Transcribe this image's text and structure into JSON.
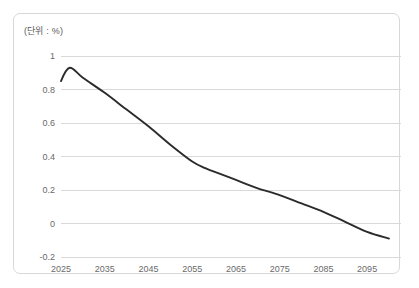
{
  "chart_data": {
    "type": "line",
    "title": "",
    "subtitle": "",
    "unit_label": "(단위 : %)",
    "xlabel": "",
    "ylabel": "",
    "xlim": [
      2025,
      2100
    ],
    "ylim": [
      -0.2,
      1.0
    ],
    "grid": "horizontal",
    "legend": "none",
    "x_ticks": [
      "2025",
      "2035",
      "2045",
      "2055",
      "2065",
      "2075",
      "2085",
      "2095"
    ],
    "x_tick_values": [
      2025,
      2035,
      2045,
      2055,
      2065,
      2075,
      2085,
      2095
    ],
    "y_ticks": [
      "1",
      "0.8",
      "0.6",
      "0.4",
      "0.2",
      "0",
      "-0.2"
    ],
    "y_tick_values": [
      1,
      0.8,
      0.6,
      0.4,
      0.2,
      0,
      -0.2
    ],
    "series": [
      {
        "name": "",
        "color": "#2b2b2b",
        "x": [
          2025,
          2027,
          2030,
          2035,
          2040,
          2045,
          2050,
          2055,
          2058,
          2060,
          2065,
          2070,
          2075,
          2080,
          2085,
          2090,
          2095,
          2100
        ],
        "values": [
          0.85,
          0.93,
          0.87,
          0.78,
          0.68,
          0.58,
          0.47,
          0.37,
          0.33,
          0.31,
          0.26,
          0.21,
          0.17,
          0.12,
          0.07,
          0.01,
          -0.05,
          -0.09
        ]
      }
    ],
    "annotations": []
  },
  "chart_colors": {
    "line": "#2b2b2b",
    "gridline": "#d9d9d9",
    "border": "#d8d8d8",
    "tick_text": "#6a6a6a",
    "background": "#ffffff"
  }
}
